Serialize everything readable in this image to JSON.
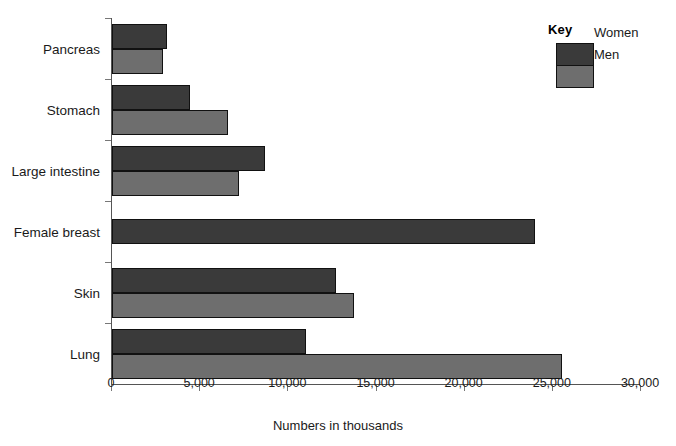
{
  "legend": {
    "title": "Key",
    "entries": [
      {
        "label": "Women",
        "color": "#3a3a3a"
      },
      {
        "label": "Men",
        "color": "#6e6e6e"
      }
    ]
  },
  "axis": {
    "x_title": "Numbers in thousands",
    "x_ticks": [
      "0",
      "5,000",
      "10,000",
      "15,000",
      "20,000",
      "25,000",
      "30,000"
    ]
  },
  "categories": {
    "pancreas": "Pancreas",
    "stomach": "Stomach",
    "large_intestine": "Large intestine",
    "female_breast": "Female breast",
    "skin": "Skin",
    "lung": "Lung"
  },
  "chart_data": {
    "type": "bar",
    "orientation": "horizontal",
    "title": "",
    "xlabel": "Numbers in thousands",
    "ylabel": "",
    "xlim": [
      0,
      30000
    ],
    "xticks": [
      0,
      5000,
      10000,
      15000,
      20000,
      25000,
      30000
    ],
    "xtick_labels": [
      "0",
      "5,000",
      "10,000",
      "15,000",
      "20,000",
      "25,000",
      "30,000"
    ],
    "grid": false,
    "legend_title": "Key",
    "legend_position": "top-right",
    "categories": [
      "Pancreas",
      "Stomach",
      "Large intestine",
      "Female breast",
      "Skin",
      "Lung"
    ],
    "series": [
      {
        "name": "Women",
        "color": "#3a3a3a",
        "values": [
          3100,
          4400,
          8700,
          24000,
          12700,
          11000
        ]
      },
      {
        "name": "Men",
        "color": "#6e6e6e",
        "values": [
          2900,
          6600,
          7200,
          null,
          13700,
          25500
        ]
      }
    ]
  }
}
